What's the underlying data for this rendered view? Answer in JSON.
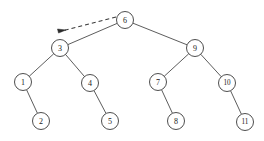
{
  "figure": {
    "kind": "binary-tree-diagram",
    "background_color": "#ffffff",
    "stroke_color": "#3a3a3a",
    "label_color": "#1a1a1a",
    "width": 264,
    "height": 141
  },
  "tree": {
    "root": "6",
    "nodes": [
      {
        "id": "n6",
        "label": "6",
        "cx": 125,
        "cy": 20,
        "r": 8.5,
        "level": 0
      },
      {
        "id": "n3",
        "label": "3",
        "cx": 60,
        "cy": 48,
        "r": 8.5,
        "level": 1
      },
      {
        "id": "n9",
        "label": "9",
        "cx": 195,
        "cy": 48,
        "r": 8.5,
        "level": 1
      },
      {
        "id": "n1",
        "label": "1",
        "cx": 23,
        "cy": 82,
        "r": 8.5,
        "level": 2
      },
      {
        "id": "n4",
        "label": "4",
        "cx": 90,
        "cy": 83,
        "r": 8.5,
        "level": 2
      },
      {
        "id": "n7",
        "label": "7",
        "cx": 158,
        "cy": 82,
        "r": 8.5,
        "level": 2
      },
      {
        "id": "n10",
        "label": "10",
        "cx": 227,
        "cy": 83,
        "r": 8.5,
        "level": 2
      },
      {
        "id": "n2",
        "label": "2",
        "cx": 41,
        "cy": 121,
        "r": 8.5,
        "level": 3
      },
      {
        "id": "n5",
        "label": "5",
        "cx": 110,
        "cy": 121,
        "r": 8.5,
        "level": 3
      },
      {
        "id": "n8",
        "label": "8",
        "cx": 176,
        "cy": 121,
        "r": 8.5,
        "level": 3
      },
      {
        "id": "n11",
        "label": "11",
        "cx": 245,
        "cy": 122,
        "r": 8.5,
        "level": 3
      }
    ],
    "edges": [
      {
        "from": "n6",
        "to": "n3",
        "side": "left"
      },
      {
        "from": "n6",
        "to": "n9",
        "side": "right"
      },
      {
        "from": "n3",
        "to": "n1",
        "side": "left"
      },
      {
        "from": "n3",
        "to": "n4",
        "side": "right"
      },
      {
        "from": "n9",
        "to": "n7",
        "side": "left"
      },
      {
        "from": "n9",
        "to": "n10",
        "side": "right"
      },
      {
        "from": "n1",
        "to": "n2",
        "side": "right"
      },
      {
        "from": "n4",
        "to": "n5",
        "side": "right"
      },
      {
        "from": "n7",
        "to": "n8",
        "side": "right"
      },
      {
        "from": "n10",
        "to": "n11",
        "side": "right"
      }
    ]
  },
  "pointer": {
    "style": "dashed-arrow",
    "label": "",
    "from_x": 116,
    "from_y": 17,
    "to_x": 66,
    "to_y": 30,
    "target_node": "n6"
  }
}
